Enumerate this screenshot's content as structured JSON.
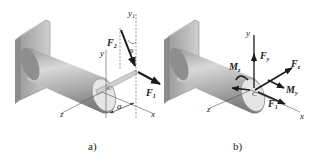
{
  "figure": {
    "panel_a": {
      "caption": "a)",
      "labels": {
        "y": "y",
        "y1": "y",
        "y1_sub": "1",
        "F2": "F",
        "F2_sub": "2",
        "phi": "φ",
        "F1": "F",
        "F1_sub": "1",
        "C": "C",
        "a": "a",
        "z": "z",
        "x": "x"
      }
    },
    "panel_b": {
      "caption": "b)",
      "labels": {
        "y": "y",
        "Fy": "F",
        "Fy_sub": "y",
        "Mz": "M",
        "Mz_sub": "z",
        "Fz": "F",
        "Fz_sub": "z",
        "My": "M",
        "My_sub": "y",
        "F1": "F",
        "F1_sub": "1",
        "C": "C",
        "z": "z",
        "x": "x"
      }
    },
    "colors": {
      "cylinder_light": "#d8d8d8",
      "cylinder_dark": "#8a8a8a",
      "wall": "#b5b5b5",
      "arrow": "#1a1a1a",
      "axis": "#555555"
    }
  }
}
